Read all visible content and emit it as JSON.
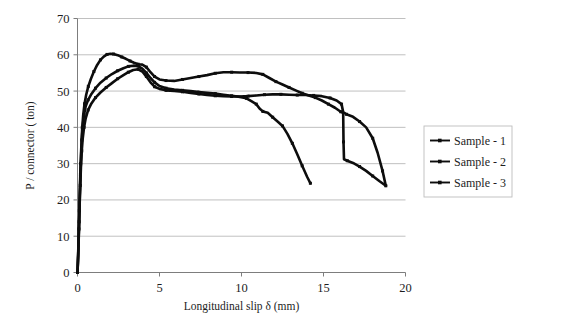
{
  "chart_data": {
    "type": "line",
    "title": "",
    "xlabel": "Longitudinal slip δ (mm)",
    "ylabel": "P / connector ( ton)",
    "xlim": [
      0,
      20
    ],
    "ylim": [
      0,
      70
    ],
    "xticks": [
      "0",
      "5",
      "10",
      "15",
      "20"
    ],
    "xtick_values": [
      0,
      5,
      10,
      15,
      20
    ],
    "yticks": [
      "0",
      "10",
      "20",
      "30",
      "40",
      "50",
      "60",
      "70"
    ],
    "ytick_values": [
      0,
      10,
      20,
      30,
      40,
      50,
      60,
      70
    ],
    "grid": "horizontal",
    "legend_position": "right",
    "marker": "small-square",
    "line_color": "#0d0d0d",
    "series": [
      {
        "name": "Sample - 1",
        "legend_label": "Sample - 1",
        "points": [
          [
            0.0,
            0.0
          ],
          [
            0.05,
            6.0
          ],
          [
            0.1,
            14.0
          ],
          [
            0.14,
            21.0
          ],
          [
            0.18,
            27.0
          ],
          [
            0.22,
            32.0
          ],
          [
            0.26,
            36.5
          ],
          [
            0.32,
            40.5
          ],
          [
            0.4,
            43.5
          ],
          [
            0.5,
            45.8
          ],
          [
            0.65,
            47.6
          ],
          [
            0.85,
            49.2
          ],
          [
            1.1,
            50.8
          ],
          [
            1.4,
            52.3
          ],
          [
            1.75,
            53.6
          ],
          [
            2.1,
            54.7
          ],
          [
            2.45,
            55.6
          ],
          [
            2.8,
            56.3
          ],
          [
            3.1,
            56.8
          ],
          [
            3.4,
            57.0
          ],
          [
            3.7,
            56.9
          ],
          [
            3.95,
            56.2
          ],
          [
            4.2,
            55.0
          ],
          [
            4.45,
            53.6
          ],
          [
            4.7,
            52.4
          ],
          [
            5.0,
            51.4
          ],
          [
            5.4,
            50.8
          ],
          [
            5.9,
            50.4
          ],
          [
            6.4,
            50.2
          ],
          [
            6.9,
            50.0
          ],
          [
            7.4,
            49.7
          ],
          [
            7.9,
            49.5
          ],
          [
            8.4,
            49.3
          ],
          [
            8.9,
            49.0
          ],
          [
            9.4,
            48.7
          ],
          [
            9.9,
            48.4
          ],
          [
            10.3,
            48.0
          ],
          [
            10.6,
            47.2
          ],
          [
            10.9,
            46.4
          ],
          [
            11.1,
            45.2
          ],
          [
            11.3,
            44.4
          ],
          [
            11.6,
            44.0
          ],
          [
            11.9,
            42.8
          ],
          [
            12.2,
            41.6
          ],
          [
            12.5,
            40.4
          ],
          [
            12.8,
            38.2
          ],
          [
            13.1,
            35.6
          ],
          [
            13.4,
            32.6
          ],
          [
            13.7,
            29.4
          ],
          [
            14.0,
            26.4
          ],
          [
            14.2,
            24.6
          ]
        ]
      },
      {
        "name": "Sample - 2",
        "legend_label": "Sample - 2",
        "points": [
          [
            0.0,
            0.0
          ],
          [
            0.06,
            8.0
          ],
          [
            0.11,
            17.0
          ],
          [
            0.15,
            24.0
          ],
          [
            0.19,
            30.0
          ],
          [
            0.24,
            35.5
          ],
          [
            0.29,
            40.0
          ],
          [
            0.35,
            43.5
          ],
          [
            0.43,
            46.5
          ],
          [
            0.53,
            49.0
          ],
          [
            0.66,
            51.3
          ],
          [
            0.82,
            53.4
          ],
          [
            1.0,
            55.4
          ],
          [
            1.2,
            57.2
          ],
          [
            1.4,
            58.6
          ],
          [
            1.6,
            59.5
          ],
          [
            1.8,
            60.1
          ],
          [
            2.0,
            60.3
          ],
          [
            2.2,
            60.2
          ],
          [
            2.45,
            59.9
          ],
          [
            2.7,
            59.4
          ],
          [
            2.95,
            58.9
          ],
          [
            3.2,
            58.3
          ],
          [
            3.45,
            57.8
          ],
          [
            3.7,
            57.4
          ],
          [
            3.95,
            57.3
          ],
          [
            4.2,
            56.6
          ],
          [
            4.45,
            55.2
          ],
          [
            4.7,
            54.0
          ],
          [
            5.0,
            53.2
          ],
          [
            5.4,
            52.9
          ],
          [
            5.9,
            52.8
          ],
          [
            6.4,
            53.2
          ],
          [
            6.9,
            53.6
          ],
          [
            7.4,
            54.0
          ],
          [
            7.9,
            54.4
          ],
          [
            8.4,
            54.9
          ],
          [
            8.9,
            55.2
          ],
          [
            9.4,
            55.2
          ],
          [
            9.9,
            55.1
          ],
          [
            10.4,
            55.1
          ],
          [
            10.9,
            55.0
          ],
          [
            11.3,
            54.6
          ],
          [
            11.7,
            53.6
          ],
          [
            12.1,
            52.6
          ],
          [
            12.5,
            51.8
          ],
          [
            12.9,
            51.0
          ],
          [
            13.3,
            50.2
          ],
          [
            13.7,
            49.4
          ],
          [
            14.1,
            48.8
          ],
          [
            14.5,
            48.2
          ],
          [
            14.9,
            47.4
          ],
          [
            15.3,
            46.4
          ],
          [
            15.7,
            45.4
          ],
          [
            16.05,
            44.3
          ],
          [
            16.2,
            44.0
          ],
          [
            16.22,
            36.0
          ],
          [
            16.25,
            31.2
          ],
          [
            16.45,
            30.8
          ],
          [
            16.8,
            30.2
          ],
          [
            17.2,
            29.2
          ],
          [
            17.6,
            28.0
          ],
          [
            18.0,
            26.6
          ],
          [
            18.4,
            25.2
          ],
          [
            18.8,
            23.9
          ]
        ]
      },
      {
        "name": "Sample - 3",
        "legend_label": "Sample - 3",
        "points": [
          [
            0.0,
            0.0
          ],
          [
            0.05,
            5.0
          ],
          [
            0.09,
            12.0
          ],
          [
            0.13,
            18.5
          ],
          [
            0.17,
            24.0
          ],
          [
            0.21,
            29.0
          ],
          [
            0.26,
            33.5
          ],
          [
            0.32,
            37.0
          ],
          [
            0.4,
            40.0
          ],
          [
            0.5,
            42.5
          ],
          [
            0.65,
            44.8
          ],
          [
            0.85,
            46.6
          ],
          [
            1.1,
            48.2
          ],
          [
            1.4,
            49.6
          ],
          [
            1.75,
            51.0
          ],
          [
            2.1,
            52.2
          ],
          [
            2.45,
            53.4
          ],
          [
            2.8,
            54.4
          ],
          [
            3.1,
            55.2
          ],
          [
            3.4,
            55.8
          ],
          [
            3.7,
            56.0
          ],
          [
            3.95,
            55.4
          ],
          [
            4.2,
            54.0
          ],
          [
            4.45,
            52.4
          ],
          [
            4.7,
            51.2
          ],
          [
            5.0,
            50.6
          ],
          [
            5.4,
            50.2
          ],
          [
            5.9,
            50.0
          ],
          [
            6.4,
            49.8
          ],
          [
            6.9,
            49.5
          ],
          [
            7.4,
            49.2
          ],
          [
            7.9,
            48.9
          ],
          [
            8.4,
            48.7
          ],
          [
            8.9,
            48.6
          ],
          [
            9.4,
            48.5
          ],
          [
            9.9,
            48.5
          ],
          [
            10.4,
            48.6
          ],
          [
            10.9,
            48.8
          ],
          [
            11.4,
            49.0
          ],
          [
            11.9,
            49.1
          ],
          [
            12.4,
            49.1
          ],
          [
            12.9,
            49.0
          ],
          [
            13.4,
            48.9
          ],
          [
            13.9,
            48.9
          ],
          [
            14.4,
            48.8
          ],
          [
            14.9,
            48.6
          ],
          [
            15.4,
            48.1
          ],
          [
            15.8,
            47.4
          ],
          [
            16.1,
            46.4
          ],
          [
            16.2,
            44.2
          ],
          [
            16.4,
            43.6
          ],
          [
            16.8,
            42.9
          ],
          [
            17.2,
            41.6
          ],
          [
            17.6,
            40.0
          ],
          [
            18.0,
            37.0
          ],
          [
            18.3,
            33.0
          ],
          [
            18.6,
            28.0
          ],
          [
            18.8,
            23.9
          ]
        ]
      }
    ]
  }
}
